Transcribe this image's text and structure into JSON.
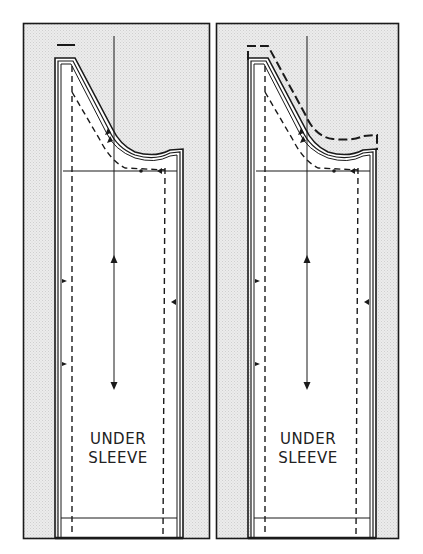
{
  "figure": {
    "panels": [
      {
        "id": "left",
        "label_line1": "UNDER",
        "label_line2": "SLEEVE",
        "variant": "original pattern with cut line"
      },
      {
        "id": "right",
        "label_line1": "UNDER",
        "label_line2": "SLEEVE",
        "variant": "pattern with extended dashed cap adjustment"
      }
    ],
    "colors": {
      "background": "#ffffff",
      "panel_fill": "#e6e6e6",
      "pattern_fill": "#ffffff",
      "line": "#1a1a1a"
    }
  }
}
